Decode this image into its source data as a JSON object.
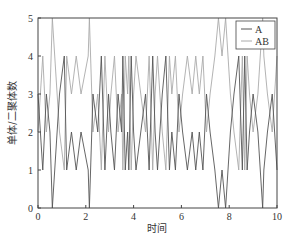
{
  "chart_data": {
    "type": "line",
    "title": "",
    "xlabel": "时间",
    "ylabel": "单体/二聚体数",
    "xlim": [
      0,
      10
    ],
    "ylim": [
      0,
      5
    ],
    "xticks": [
      0,
      2,
      4,
      6,
      8,
      10
    ],
    "yticks": [
      0,
      1,
      2,
      3,
      4,
      5
    ],
    "grid": false,
    "legend_position": "upper right",
    "x": [
      0,
      0.2,
      0.35,
      0.5,
      0.6,
      0.9,
      1.1,
      1.2,
      1.4,
      1.6,
      1.8,
      2.1,
      2.15,
      2.3,
      2.5,
      2.65,
      2.8,
      2.95,
      3.05,
      3.2,
      3.35,
      3.5,
      3.55,
      3.65,
      3.75,
      3.8,
      3.9,
      4.0,
      4.1,
      4.3,
      4.5,
      4.65,
      4.8,
      4.9,
      5.0,
      5.2,
      5.35,
      5.5,
      5.6,
      5.75,
      5.9,
      6.05,
      6.25,
      6.45,
      6.6,
      6.75,
      6.9,
      7.05,
      7.2,
      7.4,
      7.55,
      7.7,
      7.85,
      7.95,
      8.05,
      8.2,
      8.4,
      8.55,
      8.65,
      8.75,
      8.85,
      9.0,
      9.2,
      9.4,
      9.45,
      9.6,
      9.8,
      10.0
    ],
    "series": [
      {
        "name": "A",
        "color": "#555555",
        "values": [
          3,
          1,
          3,
          2,
          0,
          3,
          4,
          1,
          2,
          1,
          2,
          1,
          0,
          3,
          2,
          4,
          1,
          3,
          2,
          1,
          3,
          2,
          4,
          1,
          2,
          1,
          4,
          2,
          1,
          2,
          3,
          1,
          4,
          2,
          1,
          3,
          4,
          1,
          2,
          1,
          3,
          2,
          1,
          2,
          1,
          2,
          1,
          3,
          2,
          1,
          0,
          1,
          0,
          1,
          2,
          3,
          4,
          1,
          4,
          1,
          2,
          3,
          2,
          0,
          1,
          2,
          3,
          1
        ]
      },
      {
        "name": "AB",
        "color": "#aaaaaa",
        "values": [
          2,
          4,
          2,
          3,
          5,
          2,
          1,
          4,
          3,
          4,
          3,
          4,
          5,
          2,
          3,
          1,
          4,
          2,
          3,
          4,
          2,
          3,
          1,
          4,
          3,
          4,
          1,
          3,
          4,
          3,
          2,
          4,
          1,
          3,
          4,
          2,
          1,
          4,
          3,
          4,
          2,
          3,
          4,
          3,
          4,
          3,
          4,
          2,
          3,
          4,
          5,
          4,
          5,
          4,
          3,
          2,
          1,
          4,
          1,
          4,
          3,
          2,
          3,
          5,
          4,
          3,
          2,
          4
        ]
      }
    ]
  },
  "legend": {
    "items": [
      "A",
      "AB"
    ]
  },
  "axes": {
    "xlabel": "时间",
    "ylabel": "单体/二聚体数"
  }
}
